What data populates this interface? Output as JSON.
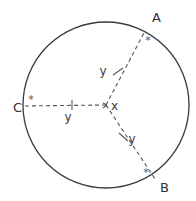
{
  "figure": {
    "background_color": "#ffffff",
    "stroke_color": "#3a3a40",
    "dash_color": "#55555c"
  },
  "circle": {
    "center": {
      "x": 106,
      "y": 105
    },
    "radius": 83,
    "center_label": "x"
  },
  "points": [
    {
      "id": "A",
      "label": "A",
      "x": 145,
      "y": 31,
      "label_x": 152,
      "label_y": 22,
      "tick": "*",
      "tick_x": 148,
      "tick_y": 44
    },
    {
      "id": "B",
      "label": "B",
      "x": 155,
      "y": 179,
      "label_x": 160,
      "label_y": 192,
      "tick": "*",
      "tick_x": 146,
      "tick_y": 176
    },
    {
      "id": "C",
      "label": "C",
      "x": 23,
      "y": 106,
      "label_x": 13,
      "label_y": 112,
      "tick": "*",
      "tick_x": 29,
      "tick_y": 103
    }
  ],
  "radii": [
    {
      "to": "A",
      "label": "y",
      "label_x": 103,
      "label_y": 75,
      "tick_x": 118,
      "tick_y": 71
    },
    {
      "to": "B",
      "label": "y",
      "label_x": 130,
      "label_y": 142,
      "tick_x": 124,
      "tick_y": 137
    },
    {
      "to": "C",
      "label": "y",
      "label_x": 68,
      "label_y": 121,
      "tick_x": 72,
      "tick_y": 105
    }
  ]
}
